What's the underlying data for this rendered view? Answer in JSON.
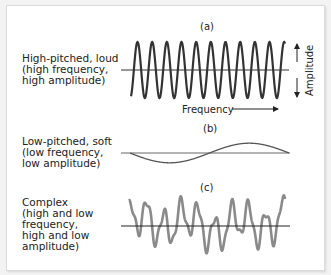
{
  "panels": [
    {
      "id": "a",
      "label": "(a)",
      "description": "High-pitched, loud\n(high frequency,\nhigh amplitude)",
      "wave": {
        "type": "sine",
        "cycles": 10.5,
        "amplitude": 1.0,
        "color": "#333333"
      }
    },
    {
      "id": "b",
      "label": "(b)",
      "description": "Low-pitched, soft\n(low frequency,\nlow amplitude)",
      "wave": {
        "type": "sine",
        "cycles": 1.5,
        "amplitude": 0.35,
        "color": "#666666"
      }
    },
    {
      "id": "c",
      "label": "(c)",
      "description": "Complex\n(high and low\nfrequency,\nhigh and low\namplitude)",
      "wave": {
        "type": "complex",
        "color": "#8a8a8a"
      }
    }
  ],
  "axes": {
    "amplitude_label": "Amplitude",
    "frequency_label": "Frequency"
  },
  "colors": {
    "axis_line": "#333333",
    "background": "#ffffff"
  }
}
